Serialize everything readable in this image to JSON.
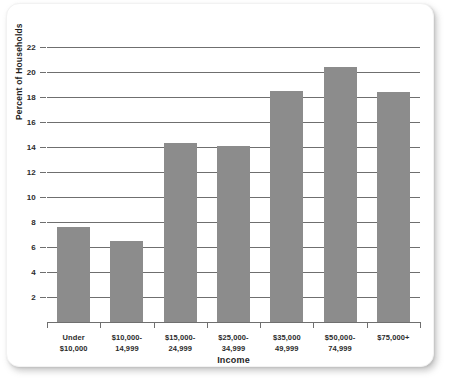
{
  "card": {
    "background_color": "#ffffff",
    "shadow_color": "#828282"
  },
  "chart_data": {
    "type": "bar",
    "title": "",
    "subtitle": "",
    "xlabel": "Income",
    "ylabel": "Percent of Households",
    "categories": [
      "Under $10,000",
      "$10,000-14,999",
      "$15,000-24,999",
      "$25,000-34,999",
      "$35,000 49,999",
      "$50,000-74,999",
      "$75,000+"
    ],
    "category_lines": [
      [
        "Under",
        "$10,000"
      ],
      [
        "$10,000-",
        "14,999"
      ],
      [
        "$15,000-",
        "24,999"
      ],
      [
        "$25,000-",
        "34,999"
      ],
      [
        "$35,000",
        "49,999"
      ],
      [
        "$50,000-",
        "74,999"
      ],
      [
        "$75,000+",
        ""
      ]
    ],
    "values": [
      7.6,
      6.5,
      14.3,
      14.1,
      18.5,
      20.4,
      18.4
    ],
    "ylim": [
      0,
      22
    ],
    "yticks": [
      2,
      4,
      6,
      8,
      10,
      12,
      14,
      16,
      18,
      20,
      22
    ],
    "ytick_labels": [
      "2",
      "4",
      "6",
      "8",
      "10",
      "12",
      "14",
      "16",
      "18",
      "20",
      "22"
    ],
    "grid": true,
    "grid_axis": "y",
    "legend": false,
    "legend_position": "none",
    "bar_color": "#8c8c8c",
    "axis_color": "#6f6f6f"
  }
}
